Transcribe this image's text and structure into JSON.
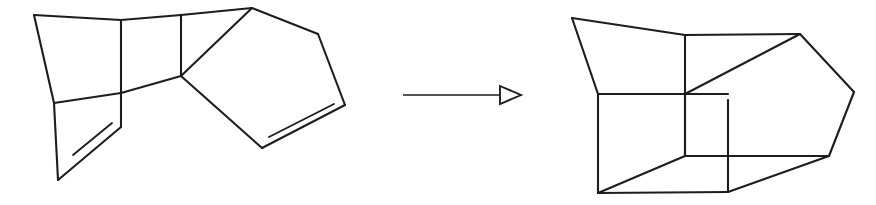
{
  "scheme": {
    "title": "Chemical reaction scheme",
    "background_color": "#ffffff",
    "bond_color": "#1d1d1d",
    "canvas": {
      "width": 876,
      "height": 205
    },
    "reactant": {
      "name": "bicyclic-diene-reactant",
      "label": "starting diene",
      "description": "Fused bicyclic hydrocarbon drawn as a four-membered/five-membered ring system bearing two carbon-carbon double bonds",
      "ring_count": 3,
      "double_bond_count": 2,
      "skeleton_paths": [
        "M 34 15 L 121 20",
        "M 121 20 L 181 15",
        "M 181 15 L 252 8",
        "M 34 15 L 54 103",
        "M 54 103 L 121 93",
        "M 121 93 L 181 76",
        "M 121 20 L 121 127",
        "M 181 15 L 181 76",
        "M 54 103 L 58 180",
        "M 58 180 L 121 127",
        "M 181 76 L 252 8",
        "M 252 8 L 318 34",
        "M 318 34 L 345 105",
        "M 345 105 L 262 148",
        "M 262 148 L 181 76"
      ],
      "double_bond_inner_paths": [
        "M 73 155 L 112 123",
        "M 269 137 L 334 104"
      ]
    },
    "arrow": {
      "name": "reaction-arrow",
      "direction": "left-to-right",
      "head_style": "open-triangle",
      "shaft_path": "M 403 95 L 500 95",
      "head_points": "500,86 521,95 500,104"
    },
    "product": {
      "name": "polycyclic-cage-product",
      "label": "cage product",
      "description": "Fused polycyclic cage hydrocarbon with a cyclobutane core fused to a cyclopentane ring, no remaining double bonds",
      "ring_count": 4,
      "double_bond_count": 0,
      "skeleton_paths": [
        "M 572 18 L 685 35",
        "M 685 35 L 800 34",
        "M 572 18 L 598 94",
        "M 598 94 L 685 94",
        "M 685 94 L 800 34",
        "M 685 35 L 685 156",
        "M 598 94 L 598 193",
        "M 685 94 L 685 156",
        "M 598 193 L 728 192",
        "M 728 192 L 728 100",
        "M 598 193 L 685 156",
        "M 685 156 L 829 156",
        "M 800 34 L 854 92",
        "M 854 92 L 829 156",
        "M 829 156 L 728 192",
        "M 685 94 L 728 94"
      ]
    }
  }
}
